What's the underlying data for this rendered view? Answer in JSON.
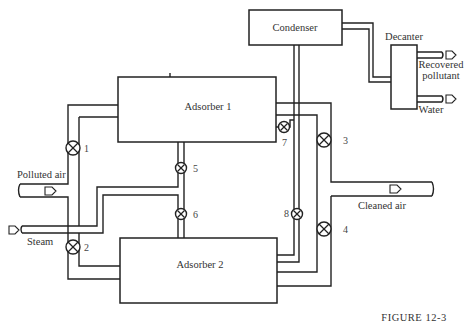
{
  "figure": {
    "caption": "FIGURE 12-3",
    "units": {
      "condenser": "Condenser",
      "decanter": "Decanter",
      "adsorber1": "Adsorber 1",
      "adsorber2": "Adsorber 2"
    },
    "streams": {
      "polluted_air": "Polluted air",
      "steam": "Steam",
      "cleaned_air": "Cleaned air",
      "recovered_pollutant_line1": "Recovered",
      "recovered_pollutant_line2": "pollutant",
      "water": "Water"
    },
    "valves": [
      "1",
      "2",
      "3",
      "4",
      "5",
      "6",
      "7",
      "8"
    ]
  }
}
